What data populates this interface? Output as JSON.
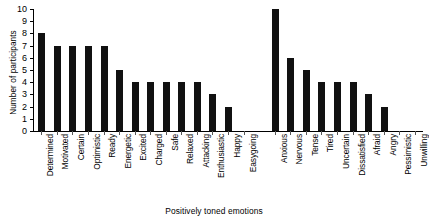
{
  "chart_data": {
    "type": "bar",
    "title": "",
    "xlabel": "Positively toned emotions",
    "ylabel": "Number of participants",
    "ylim": [
      0,
      10
    ],
    "ytick_labels": [
      "0",
      "1",
      "2",
      "3",
      "4",
      "5",
      "6",
      "7",
      "8",
      "9",
      "10"
    ],
    "grid": false,
    "legend": null,
    "categories": [
      "Determined",
      "Motivated",
      "Certain",
      "Optimistic",
      "Ready",
      "Energetic",
      "Excited",
      "Charged",
      "Safe",
      "Relaxed",
      "Attacking",
      "Enthusiastic",
      "Happy",
      "Easygoing",
      "",
      "Anxious",
      "Nervous",
      "Tense",
      "Tired",
      "Uncertain",
      "Dissatisfied",
      "Afraid",
      "Angry",
      "Pessimistic",
      "Unwilling"
    ],
    "values": [
      8,
      7,
      7,
      7,
      7,
      5,
      4,
      4,
      4,
      4,
      4,
      3,
      2,
      0,
      0,
      10,
      6,
      5,
      4,
      4,
      4,
      3,
      2,
      0,
      0
    ],
    "bar_color": "#111111"
  },
  "top_caption": ""
}
